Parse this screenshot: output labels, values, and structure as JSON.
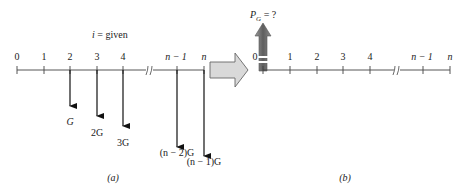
{
  "diagram": {
    "left_panel": {
      "caption": "(a)",
      "interest_label": "i = given",
      "axis_labels": [
        "0",
        "1",
        "2",
        "3",
        "4",
        "n − 1",
        "n"
      ],
      "cash_flows": [
        {
          "period": "2",
          "label": "G"
        },
        {
          "period": "3",
          "label": "2G"
        },
        {
          "period": "4",
          "label": "3G"
        },
        {
          "period": "n − 1",
          "label": "(n − 2)G"
        },
        {
          "period": "n",
          "label": "(n − 1)G"
        }
      ]
    },
    "transform_arrow": {
      "direction": "right",
      "fill": "#d9d9d9",
      "stroke": "#555555"
    },
    "right_panel": {
      "caption": "(b)",
      "present_worth_label": "P",
      "present_worth_subscript": "G",
      "present_worth_suffix": " = ?",
      "axis_labels": [
        "0",
        "1",
        "2",
        "3",
        "4",
        "n − 1",
        "n"
      ],
      "arrow_color": "#6e6e6e"
    },
    "colors": {
      "line": "#333333",
      "arrow_fill": "#777777"
    }
  }
}
